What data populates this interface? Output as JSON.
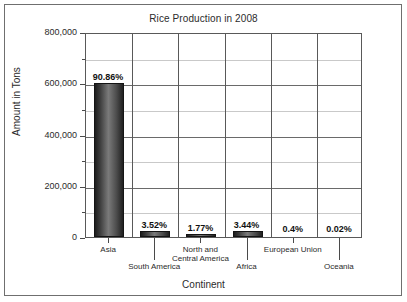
{
  "chart_data": {
    "type": "bar",
    "title": "Rice Production in 2008",
    "xlabel": "Continent",
    "ylabel": "Amount in Tons",
    "categories": [
      "Asia",
      "South America",
      "North and Central America",
      "Africa",
      "European Union",
      "Oceania"
    ],
    "values": [
      600000,
      23200,
      11700,
      22700,
      2600,
      130
    ],
    "data_labels": [
      "90.86%",
      "3.52%",
      "1.77%",
      "3.44%",
      "0.4%",
      "0.02%"
    ],
    "ylim": [
      0,
      800000
    ],
    "ytick_labels": [
      "0",
      "200,000",
      "400,000",
      "600,000",
      "800,000"
    ],
    "ytick_values": [
      0,
      200000,
      400000,
      600000,
      800000
    ],
    "minor_gridline_values": [
      100000,
      300000,
      500000,
      700000
    ],
    "grid": true,
    "legend": "none",
    "bar_color": "#3c3c3c",
    "grid_color": "#c9c9c9",
    "axis_color": "#595959",
    "label_rows": [
      0,
      1,
      0,
      1,
      0,
      1
    ]
  }
}
